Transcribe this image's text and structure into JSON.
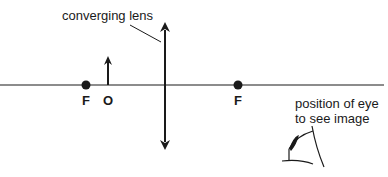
{
  "diagram": {
    "type": "ray-optics",
    "labels": {
      "lens": "converging lens",
      "focal_left": "F",
      "object": "O",
      "focal_right": "F",
      "eye_line1": "position of eye",
      "eye_line2": "to see image"
    },
    "colors": {
      "stroke": "#1a1a1a",
      "background": "#ffffff"
    }
  }
}
